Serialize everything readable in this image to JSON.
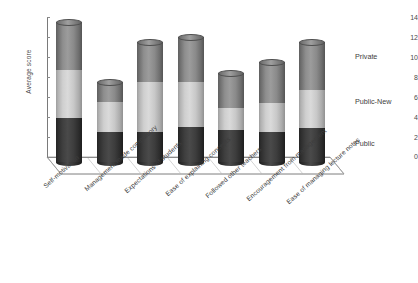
{
  "chart_data": {
    "type": "bar",
    "subtype": "stacked-3d-cylinder",
    "title": "",
    "xlabel": "",
    "ylabel": "Average score",
    "ylim": [
      0,
      14
    ],
    "yticks": [
      0,
      2,
      4,
      6,
      8,
      10,
      12,
      14
    ],
    "grid": false,
    "legend_position": "right",
    "categories": [
      "Self-motivation",
      "Management made compulsory",
      "Expectations of students",
      "Ease of explaining concepts",
      "Followed other teachers",
      "Encouragement from management",
      "Ease of managing lecture notes"
    ],
    "series": [
      {
        "name": "Public",
        "color": "#333333",
        "values": [
          4.4,
          3.0,
          3.0,
          3.5,
          3.2,
          3.0,
          3.4
        ]
      },
      {
        "name": "Public-New",
        "color": "#c9c9c9",
        "values": [
          4.8,
          3.0,
          5.0,
          4.5,
          2.2,
          2.9,
          3.8
        ]
      },
      {
        "name": "Private",
        "color": "#8c8c8c",
        "values": [
          4.8,
          2.0,
          4.0,
          4.5,
          3.5,
          4.1,
          4.8
        ]
      }
    ],
    "totals": [
      14.0,
      8.0,
      12.0,
      12.5,
      8.9,
      10.0,
      12.0
    ],
    "annotations": []
  },
  "axis": {
    "y_title": "Average score",
    "tick_labels": [
      "14",
      "12",
      "10",
      "8",
      "6",
      "4",
      "2",
      "0"
    ]
  },
  "legend": {
    "entries": [
      {
        "label": "Private"
      },
      {
        "label": "Public-New"
      },
      {
        "label": "Public"
      }
    ]
  },
  "colors": {
    "private": "#8c8c8c",
    "public_new": "#c9c9c9",
    "public": "#333333",
    "axis": "#7a7a7a",
    "text": "#3d3d3d",
    "background": "#ffffff"
  }
}
